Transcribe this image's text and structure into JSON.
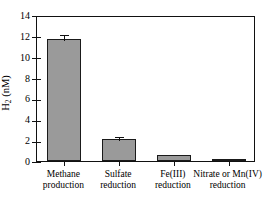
{
  "chart_data": {
    "type": "bar",
    "title": "",
    "xlabel": "",
    "ylabel": "H2 (nM)",
    "ylabel_main": "H",
    "ylabel_sub": "2",
    "ylabel_unit": " (nM)",
    "ylim": [
      0,
      14
    ],
    "ytick_values": [
      0,
      2,
      4,
      6,
      8,
      10,
      12,
      14
    ],
    "ytick_labels": [
      "0",
      "2",
      "4",
      "6",
      "8",
      "10",
      "12",
      "14"
    ],
    "grid": false,
    "legend": null,
    "categories": [
      "Methane\nproduction",
      "Sulfate\nreduction",
      "Fe(III)\nreduction",
      "Nitrate or Mn(IV)\nreduction"
    ],
    "values": [
      11.7,
      2.15,
      0.55,
      0.1
    ],
    "errors": [
      0.62,
      0.33,
      0.0,
      0.0
    ],
    "bar_color": "#9a9a9a",
    "bar_edge_color": "#1a1a1a",
    "axis_color": "#111111"
  }
}
